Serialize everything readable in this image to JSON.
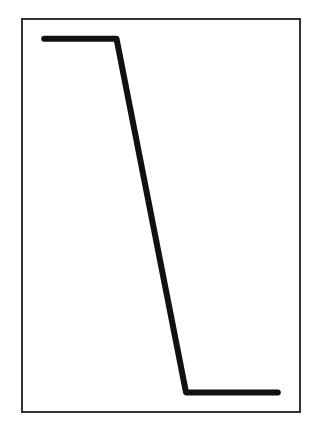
{
  "chart_data": {
    "type": "line",
    "title": "",
    "xlabel": "",
    "ylabel": "",
    "grid": false,
    "legend": null,
    "xlim": [
      0,
      1
    ],
    "ylim": [
      0,
      1
    ],
    "series": [
      {
        "name": "step-down",
        "color": "#111111",
        "points": [
          {
            "x": 0.08,
            "y": 0.95
          },
          {
            "x": 0.34,
            "y": 0.95
          },
          {
            "x": 0.59,
            "y": 0.05
          },
          {
            "x": 0.92,
            "y": 0.05
          }
        ]
      }
    ],
    "frame_color": "#333333"
  }
}
